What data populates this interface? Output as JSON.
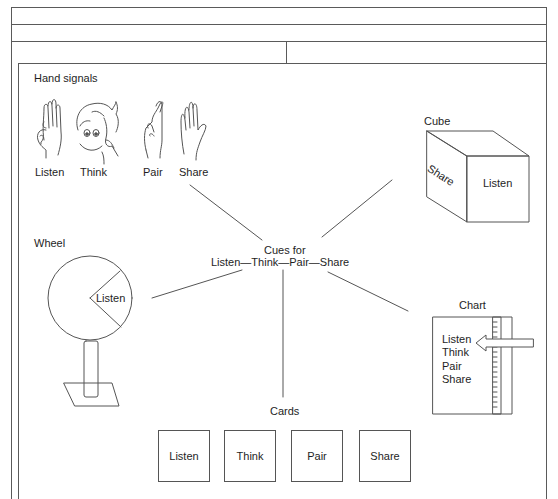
{
  "header_rows": [
    {
      "cells": [
        ""
      ]
    },
    {
      "cells": [
        ""
      ]
    },
    {
      "cells": [
        "",
        ""
      ]
    }
  ],
  "center": {
    "title_line1": "Cues for",
    "title_line2": "Listen—Think—Pair—Share"
  },
  "hand_signals": {
    "title": "Hand signals",
    "items": [
      {
        "label": "Listen",
        "icon": "hand-at-ear-icon"
      },
      {
        "label": "Think",
        "icon": "finger-at-temple-icon"
      },
      {
        "label": "Pair",
        "icon": "crossed-fingers-icon"
      },
      {
        "label": "Share",
        "icon": "open-hand-icon"
      }
    ]
  },
  "cube": {
    "title": "Cube",
    "side_face": "Share",
    "front_face": "Listen"
  },
  "wheel": {
    "title": "Wheel",
    "slice_label": "Listen"
  },
  "chart": {
    "title": "Chart",
    "items": [
      "Listen",
      "Think",
      "Pair",
      "Share"
    ]
  },
  "cards": {
    "title": "Cards",
    "items": [
      "Listen",
      "Think",
      "Pair",
      "Share"
    ]
  },
  "colors": {
    "line": "#555555",
    "text": "#1e1e1e",
    "background": "#ffffff"
  }
}
